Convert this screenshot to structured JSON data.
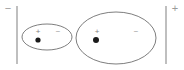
{
  "figure": {
    "background_color": "#ffffff",
    "width": 184,
    "height": 70
  },
  "colors": {
    "plate_stroke": "#8a8a8a",
    "atom_stroke": "#6f6f6f",
    "nucleus_fill": "#1a1a1a",
    "sign_text": "#8d8d8d"
  },
  "plates": {
    "left": {
      "label": "−",
      "name": "negative-plate",
      "x": 17,
      "y_top": 6,
      "y_bottom": 64,
      "label_x": 8,
      "label_y": 9
    },
    "right": {
      "label": "+",
      "name": "positive-plate",
      "x": 166,
      "y_top": 6,
      "y_bottom": 64,
      "label_x": 175,
      "label_y": 9
    }
  },
  "atoms": [
    {
      "id": "small-atom",
      "cx": 47,
      "cy": 37,
      "rx": 25,
      "ry": 13,
      "plus_label": "+",
      "plus_x": 38,
      "plus_y": 32,
      "minus_label": "−",
      "minus_x": 58,
      "minus_y": 32,
      "dot_x": 38,
      "dot_y": 40,
      "dot_r": 2.6
    },
    {
      "id": "large-atom",
      "cx": 116,
      "cy": 38,
      "rx": 40,
      "ry": 26,
      "plus_label": "+",
      "plus_x": 97,
      "plus_y": 32,
      "minus_label": "−",
      "minus_x": 136,
      "minus_y": 32,
      "dot_x": 96,
      "dot_y": 40,
      "dot_r": 3.0
    }
  ],
  "chart_data": {
    "type": "diagram",
    "elements": [
      {
        "kind": "plate",
        "label": "−",
        "side": "left"
      },
      {
        "kind": "plate",
        "label": "+",
        "side": "right"
      },
      {
        "kind": "atom",
        "size": "small",
        "charges": [
          "+",
          "−"
        ],
        "nucleus": "filled-dot"
      },
      {
        "kind": "atom",
        "size": "large",
        "charges": [
          "+",
          "−"
        ],
        "nucleus": "filled-dot"
      }
    ]
  }
}
